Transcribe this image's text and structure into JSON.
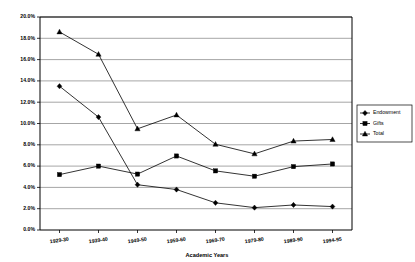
{
  "chart_data": {
    "type": "line",
    "title": "",
    "xlabel": "Academic Years",
    "ylabel": "",
    "categories": [
      "1929-30",
      "1939-40",
      "1949-50",
      "1959-60",
      "1969-70",
      "1979-80",
      "1989-90",
      "1994-95"
    ],
    "ylim": [
      0,
      20
    ],
    "ytick_labels": [
      "0.0%",
      "2.0%",
      "4.0%",
      "6.0%",
      "8.0%",
      "10.0%",
      "12.0%",
      "14.0%",
      "16.0%",
      "18.0%",
      "20.0%"
    ],
    "ytick_values": [
      0,
      2,
      4,
      6,
      8,
      10,
      12,
      14,
      16,
      18,
      20
    ],
    "grid": "horizontal",
    "legend_position": "right",
    "units": "percent",
    "series": [
      {
        "name": "Endowment",
        "marker": "diamond",
        "values": [
          13.5,
          10.6,
          4.25,
          3.8,
          2.55,
          2.1,
          2.35,
          2.2
        ]
      },
      {
        "name": "Gifts",
        "marker": "square",
        "values": [
          5.2,
          6.0,
          5.25,
          6.95,
          5.55,
          5.05,
          5.95,
          6.2
        ]
      },
      {
        "name": "Total",
        "marker": "triangle",
        "values": [
          18.6,
          16.5,
          9.5,
          10.8,
          8.05,
          7.15,
          8.35,
          8.5
        ]
      }
    ]
  },
  "legend": {
    "items": [
      {
        "label": "Endowment"
      },
      {
        "label": "Gifts"
      },
      {
        "label": "Total"
      }
    ]
  },
  "colors": {
    "line": "#000000",
    "grid": "#808080",
    "axis": "#000000",
    "background": "#ffffff"
  }
}
